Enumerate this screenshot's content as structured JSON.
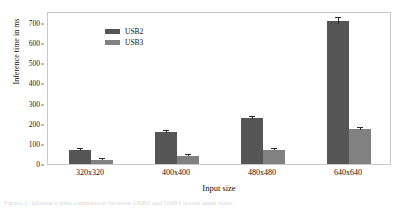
{
  "figure": {
    "caption": "Figure 1: Inference time comparison between USB2 and USB3 across input sizes."
  },
  "legend": {
    "position": "top-left",
    "items": [
      {
        "label": "USB2",
        "color": "#555555"
      },
      {
        "label": "USB3",
        "color": "#818181"
      }
    ]
  },
  "axes": {
    "ylabel": "Inference time in ms",
    "xlabel": "Input size",
    "yticks": [
      "0",
      "100",
      "200",
      "300",
      "400",
      "500",
      "600",
      "700"
    ]
  },
  "chart_data": {
    "type": "bar",
    "title": "",
    "xlabel": "Input size",
    "ylabel": "Inference time in ms",
    "categories": [
      "320x320",
      "400x400",
      "480x480",
      "640x640"
    ],
    "ylim": [
      0,
      760
    ],
    "yticks": [
      0,
      100,
      200,
      300,
      400,
      500,
      600,
      700
    ],
    "grid": false,
    "legend_position": "upper left",
    "series": [
      {
        "name": "USB2",
        "color": "#555555",
        "values": [
          70,
          160,
          230,
          710
        ],
        "errors": [
          4,
          5,
          6,
          14
        ]
      },
      {
        "name": "USB3",
        "color": "#818181",
        "values": [
          22,
          42,
          72,
          175
        ],
        "errors": [
          2,
          2,
          3,
          5
        ]
      }
    ]
  }
}
